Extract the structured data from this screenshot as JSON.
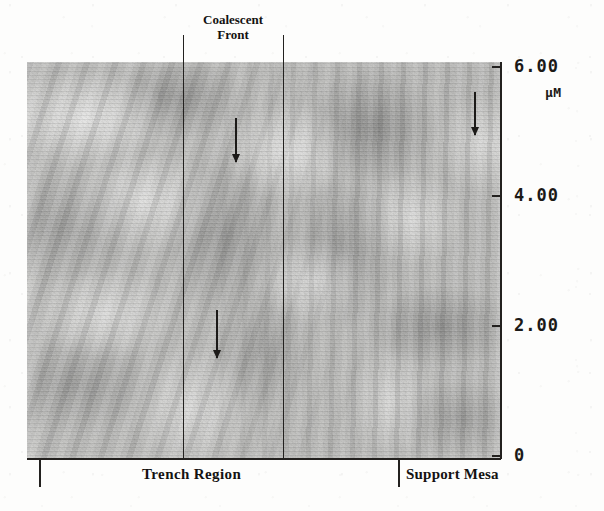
{
  "figure": {
    "kind": "afm-micrograph",
    "annotations": {
      "top_label": "Coalescent\nFront",
      "top_label_line1": "Coalescent",
      "top_label_line2": "Front",
      "bottom_left_label": "Trench Region",
      "bottom_right_label": "Support Mesa"
    },
    "vertical_axis": {
      "unit": "µM",
      "ticks": [
        {
          "label": "6.00",
          "value": 6.0,
          "y": 66
        },
        {
          "label": "4.00",
          "value": 4.0,
          "y": 195
        },
        {
          "label": "2.00",
          "value": 2.0,
          "y": 325
        },
        {
          "label": "0",
          "value": 0.0,
          "y": 455
        }
      ]
    },
    "region_lines": [
      {
        "name": "coalescent-front-left",
        "x": 183
      },
      {
        "name": "coalescent-front-right",
        "x": 283
      }
    ],
    "bottom_separators": [
      {
        "name": "left-separator",
        "x": 39
      },
      {
        "name": "right-separator",
        "x": 398
      }
    ],
    "arrows": [
      {
        "name": "arrow-coalescent-upper",
        "x": 235,
        "top": 118,
        "length": 44,
        "direction": "down"
      },
      {
        "name": "arrow-coalescent-lower",
        "x": 216,
        "top": 310,
        "length": 48,
        "direction": "down"
      },
      {
        "name": "arrow-support-mesa",
        "x": 474,
        "top": 92,
        "length": 43,
        "direction": "down"
      }
    ],
    "colors": {
      "ink": "#1b1917",
      "paper": "#fdfdfc",
      "scan_mid_gray": "#b9b9b7"
    }
  }
}
